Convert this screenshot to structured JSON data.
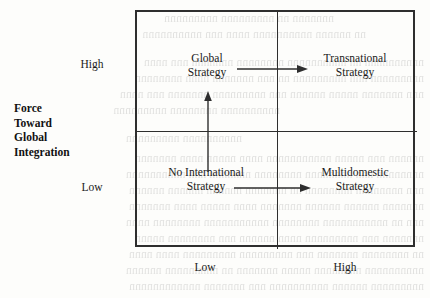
{
  "diagram": {
    "type": "2x2-matrix",
    "y_axis": {
      "title_lines": [
        "Force",
        "Toward",
        "Global",
        "Integration"
      ],
      "ticks": {
        "high": "High",
        "low": "Low"
      }
    },
    "x_axis": {
      "ticks": {
        "low": "Low",
        "high": "High"
      }
    },
    "quadrants": [
      {
        "id": "top-left",
        "line1": "Global",
        "line2": "Strategy"
      },
      {
        "id": "top-right",
        "line1": "Transnational",
        "line2": "Strategy"
      },
      {
        "id": "bottom-left",
        "line1": "No International",
        "line2": "Strategy"
      },
      {
        "id": "bottom-right",
        "line1": "Multidomestic",
        "line2": "Strategy"
      }
    ],
    "arrows": [
      {
        "id": "vertical-up",
        "direction": "up",
        "from": "bottom-left",
        "to": "top-left"
      },
      {
        "id": "horizontal-top",
        "direction": "right",
        "from": "top-left",
        "to": "top-right"
      },
      {
        "id": "horizontal-bottom",
        "direction": "right",
        "from": "bottom-left",
        "to": "bottom-right"
      }
    ],
    "colors": {
      "line": "#2e2e2e",
      "text": "#1a1a1a",
      "background": "#fdfdfb"
    }
  }
}
